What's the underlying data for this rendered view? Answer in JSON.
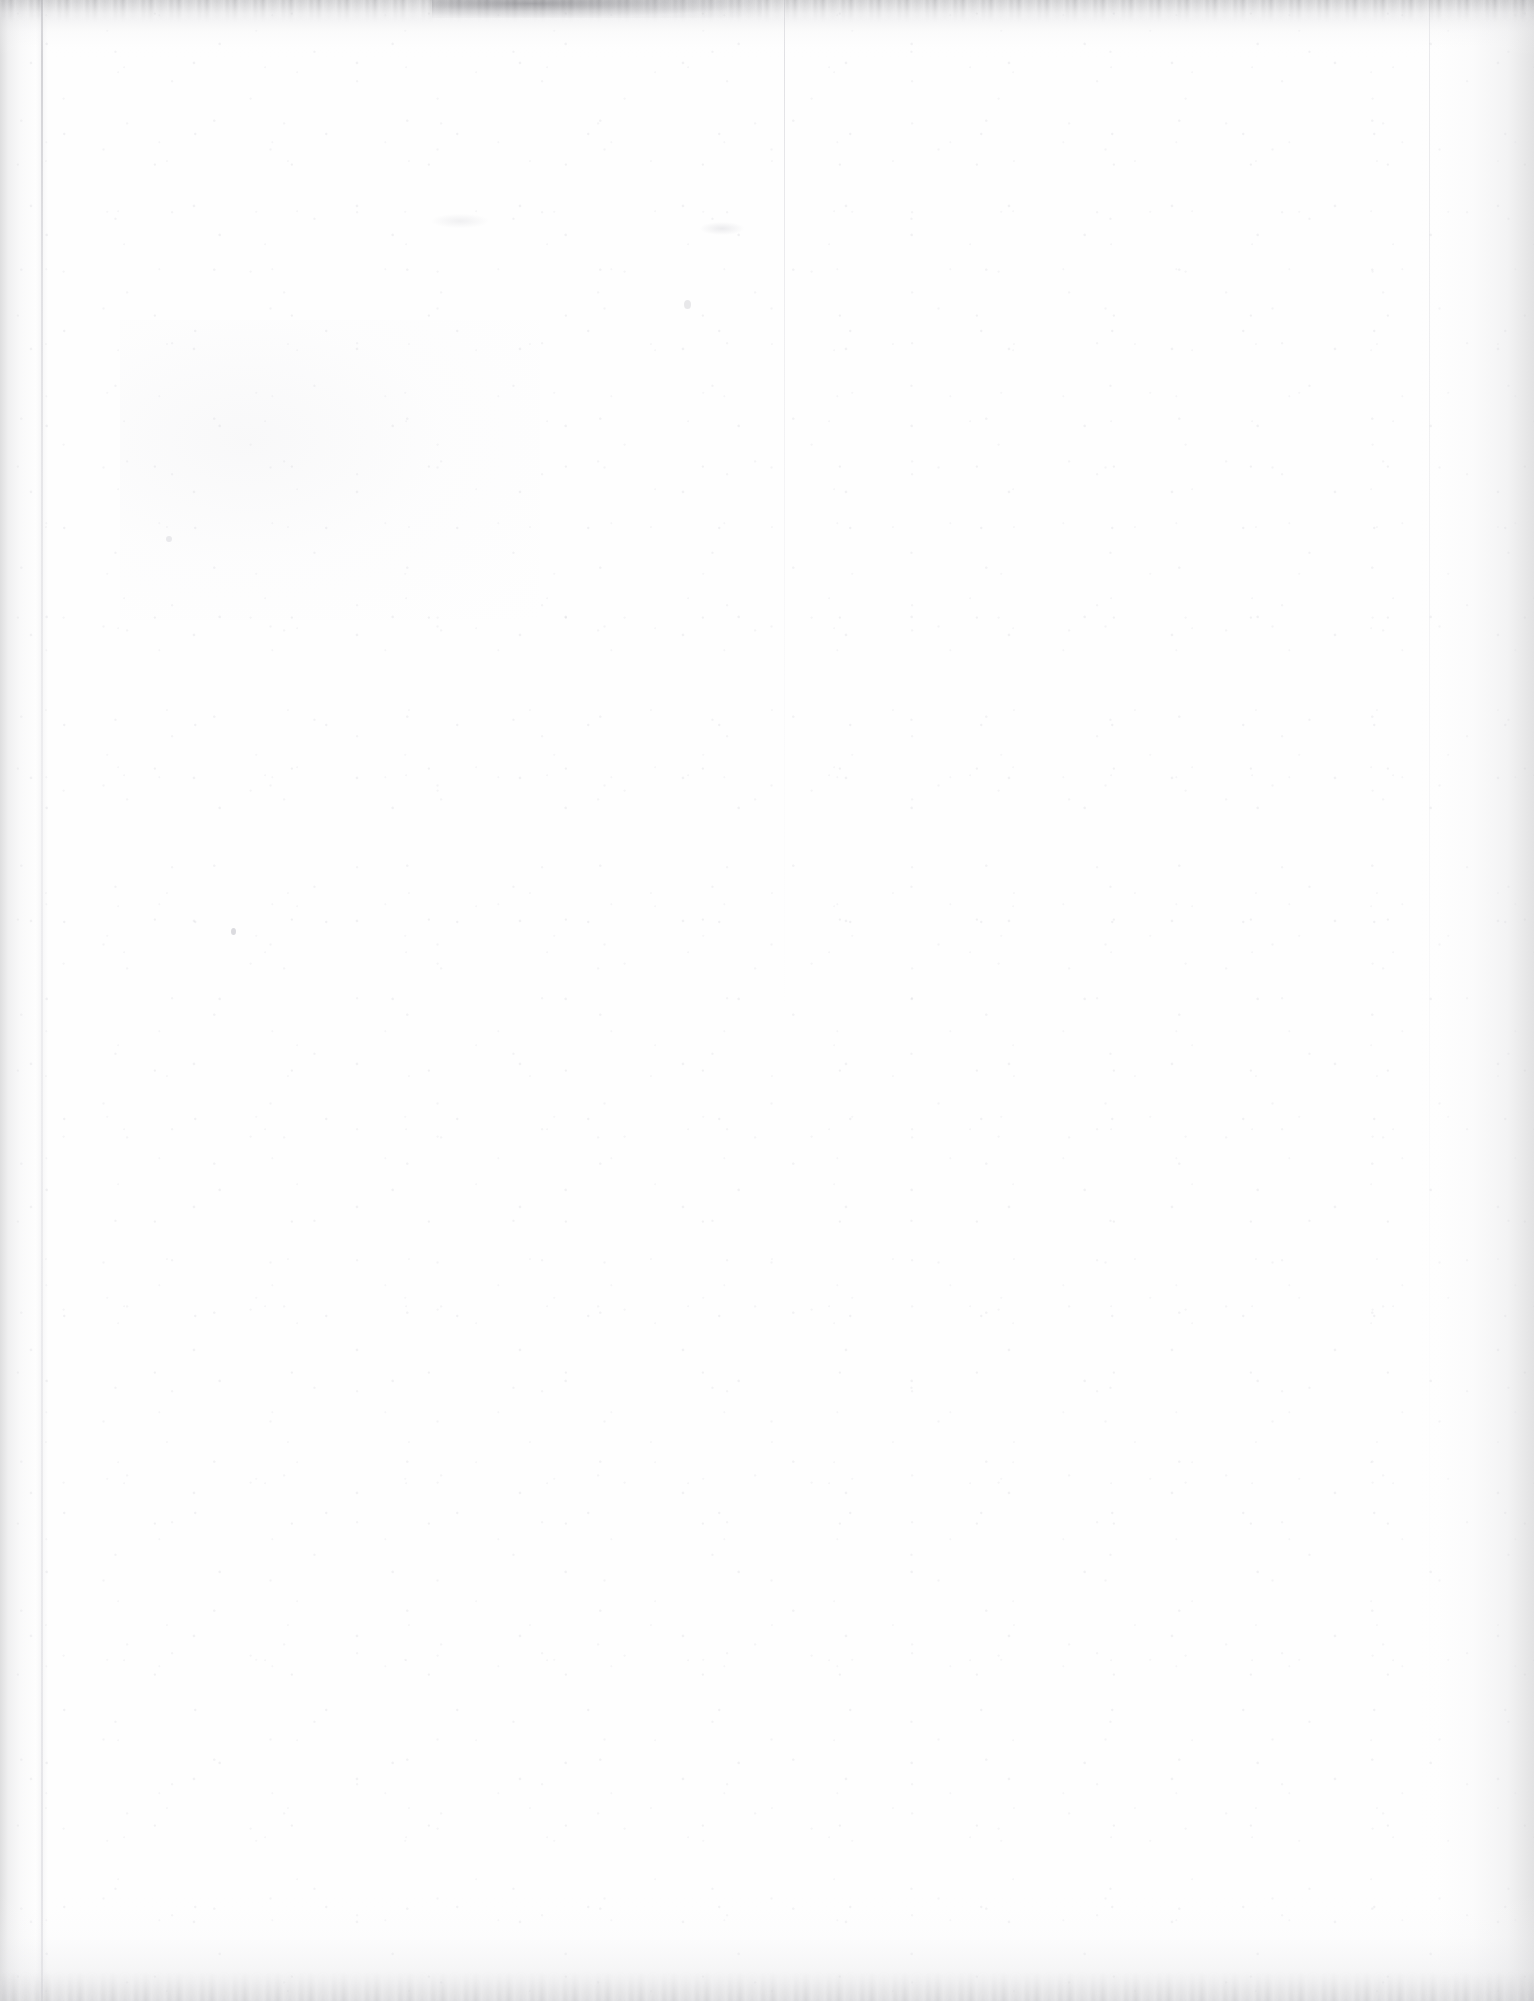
{
  "document": {
    "page_kind": "blank-scanned-page",
    "visible_text": "",
    "page_number_label": "",
    "header_text": "",
    "footer_text": "",
    "caption": ""
  },
  "scan_artifacts": {
    "description_label": "",
    "items": [
      {
        "name": "top-edge-scan-noise",
        "label": ""
      },
      {
        "name": "top-center-smudge",
        "label": ""
      },
      {
        "name": "left-fold-crease",
        "label": ""
      },
      {
        "name": "center-fold-crease",
        "label": ""
      },
      {
        "name": "right-fold-crease",
        "label": ""
      },
      {
        "name": "bottom-edge-shading",
        "label": ""
      },
      {
        "name": "paper-dust-speckles",
        "label": ""
      }
    ]
  },
  "colors": {
    "paper": "#fefefe",
    "page_background": "#ffffff",
    "edge_shadow": "#c4c4c6",
    "crease_line": "#acacb2",
    "speck": "#b2b2ba",
    "scan_noise": "#606066"
  },
  "dimensions": {
    "width_px": 1534,
    "height_px": 2001
  }
}
